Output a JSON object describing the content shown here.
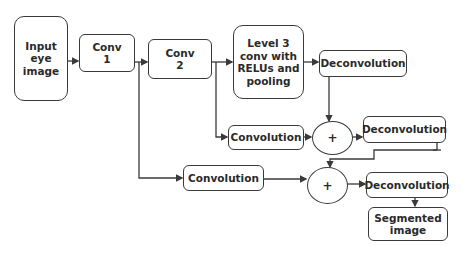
{
  "diagram": {
    "nodes": {
      "input": {
        "label": "Input\neye\nimage"
      },
      "conv1": {
        "label": "Conv\n1"
      },
      "conv2": {
        "label": "Conv\n2"
      },
      "level3": {
        "label": "Level 3\nconv with\nRELUs and\npooling"
      },
      "deconv_top": {
        "label": "Deconvolution"
      },
      "conv_mid": {
        "label": "Convolution"
      },
      "sum_mid": {
        "label": "+"
      },
      "deconv_mid": {
        "label": "Deconvolution"
      },
      "conv_low": {
        "label": "Convolution"
      },
      "sum_low": {
        "label": "+"
      },
      "deconv_low": {
        "label": "Deconvolution"
      },
      "output": {
        "label": "Segmented\nimage"
      }
    },
    "edges": [
      [
        "input",
        "conv1"
      ],
      [
        "conv1",
        "conv2"
      ],
      [
        "conv2",
        "level3"
      ],
      [
        "level3",
        "deconv_top"
      ],
      [
        "deconv_top",
        "sum_mid"
      ],
      [
        "conv2",
        "conv_mid"
      ],
      [
        "conv_mid",
        "sum_mid"
      ],
      [
        "sum_mid",
        "deconv_mid"
      ],
      [
        "deconv_mid",
        "sum_low"
      ],
      [
        "conv1",
        "conv_low"
      ],
      [
        "conv_low",
        "sum_low"
      ],
      [
        "sum_low",
        "deconv_low"
      ],
      [
        "deconv_low",
        "output"
      ]
    ]
  }
}
